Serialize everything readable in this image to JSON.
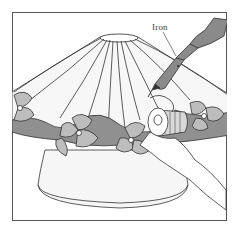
{
  "illustration": {
    "subject": "stained glass lamp shade with soldering iron",
    "callout_label": "Iron",
    "colors": {
      "background": "#ffffff",
      "outline": "#333333",
      "flower_fill": "#bdbdbd",
      "leaf_fill": "#8f8f8f",
      "iron_fill": "#8a8a8a",
      "glass_fill": "#f4f4f4"
    }
  }
}
